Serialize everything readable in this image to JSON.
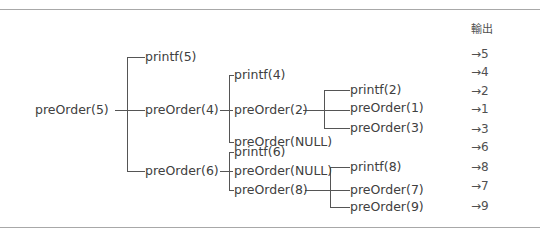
{
  "header": {
    "output_label": "輸出"
  },
  "tree": {
    "root": "preOrder(5)",
    "level1": [
      "printf(5)",
      "preOrder(4)",
      "preOrder(6)"
    ],
    "preOrder4_children": [
      "printf(4)",
      "preOrder(2)",
      "preOrder(NULL)"
    ],
    "preOrder2_children": [
      "printf(2)",
      "preOrder(1)",
      "preOrder(3)"
    ],
    "preOrder6_children": [
      "printf(6)",
      "preOrder(NULL)",
      "preOrder(8)"
    ],
    "preOrder8_children": [
      "printf(8)",
      "preOrder(7)",
      "preOrder(9)"
    ]
  },
  "outputs": [
    "→5",
    "→4",
    "→2",
    "→1",
    "→3",
    "→6",
    "→8",
    "→7",
    "→9"
  ]
}
